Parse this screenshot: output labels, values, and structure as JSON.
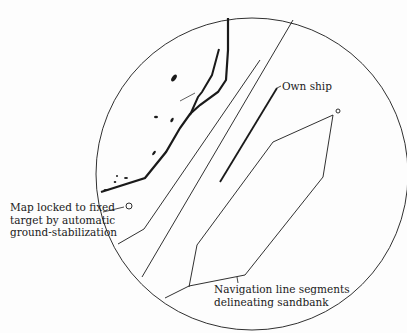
{
  "diagram": {
    "type": "radar-display",
    "labels": {
      "own_ship": "Own ship",
      "map_locked": [
        "Map locked to fixed",
        "target by automatic",
        "ground-stabilization"
      ],
      "navigation_lines": [
        "Navigation line segments",
        "delineating sandbank"
      ]
    },
    "colors": {
      "ink": "#1a1a1a",
      "background": "#fdfdfd"
    }
  }
}
